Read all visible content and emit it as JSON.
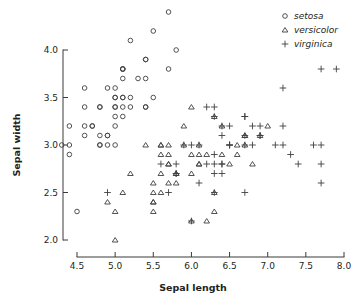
{
  "chart_data": {
    "type": "scatter",
    "title": "",
    "xlabel": "Sepal length",
    "ylabel": "Sepal width",
    "xlim": [
      4.25,
      8.05
    ],
    "ylim": [
      1.95,
      4.45
    ],
    "xticks": [
      "4.5",
      "5.0",
      "5.5",
      "6.0",
      "6.5",
      "7.0",
      "7.5",
      "8.0"
    ],
    "xtick_values": [
      4.5,
      5.0,
      5.5,
      6.0,
      6.5,
      7.0,
      7.5,
      8.0
    ],
    "yticks": [
      "2.0",
      "2.5",
      "3.0",
      "3.5",
      "4.0"
    ],
    "ytick_values": [
      2.0,
      2.5,
      3.0,
      3.5,
      4.0
    ],
    "grid": false,
    "legend_position": "top-right",
    "series": [
      {
        "name": "setosa",
        "marker": "circle",
        "color": "#3f3f3f",
        "points": [
          [
            5.1,
            3.5
          ],
          [
            4.9,
            3.0
          ],
          [
            4.7,
            3.2
          ],
          [
            4.6,
            3.1
          ],
          [
            5.0,
            3.6
          ],
          [
            5.4,
            3.9
          ],
          [
            4.6,
            3.4
          ],
          [
            5.0,
            3.4
          ],
          [
            4.4,
            2.9
          ],
          [
            4.9,
            3.1
          ],
          [
            5.4,
            3.7
          ],
          [
            4.8,
            3.4
          ],
          [
            4.8,
            3.0
          ],
          [
            4.3,
            3.0
          ],
          [
            5.8,
            4.0
          ],
          [
            5.7,
            4.4
          ],
          [
            5.4,
            3.9
          ],
          [
            5.1,
            3.5
          ],
          [
            5.7,
            3.8
          ],
          [
            5.1,
            3.8
          ],
          [
            5.4,
            3.4
          ],
          [
            5.1,
            3.7
          ],
          [
            4.6,
            3.6
          ],
          [
            5.1,
            3.3
          ],
          [
            4.8,
            3.4
          ],
          [
            5.0,
            3.0
          ],
          [
            5.0,
            3.4
          ],
          [
            5.2,
            3.5
          ],
          [
            5.2,
            3.4
          ],
          [
            4.7,
            3.2
          ],
          [
            4.8,
            3.1
          ],
          [
            5.4,
            3.4
          ],
          [
            5.2,
            4.1
          ],
          [
            5.5,
            4.2
          ],
          [
            4.9,
            3.1
          ],
          [
            5.0,
            3.2
          ],
          [
            5.5,
            3.5
          ],
          [
            4.9,
            3.6
          ],
          [
            4.4,
            3.0
          ],
          [
            5.1,
            3.4
          ],
          [
            5.0,
            3.5
          ],
          [
            4.5,
            2.3
          ],
          [
            4.4,
            3.2
          ],
          [
            5.0,
            3.5
          ],
          [
            5.1,
            3.8
          ],
          [
            4.8,
            3.0
          ],
          [
            5.1,
            3.8
          ],
          [
            4.6,
            3.2
          ],
          [
            5.3,
            3.7
          ],
          [
            5.0,
            3.3
          ]
        ]
      },
      {
        "name": "versicolor",
        "marker": "triangle",
        "color": "#3f3f3f",
        "points": [
          [
            7.0,
            3.2
          ],
          [
            6.4,
            3.2
          ],
          [
            6.9,
            3.1
          ],
          [
            5.5,
            2.3
          ],
          [
            6.5,
            2.8
          ],
          [
            5.7,
            2.8
          ],
          [
            6.3,
            3.3
          ],
          [
            4.9,
            2.4
          ],
          [
            6.6,
            2.9
          ],
          [
            5.2,
            2.7
          ],
          [
            5.0,
            2.0
          ],
          [
            5.9,
            3.0
          ],
          [
            6.0,
            2.2
          ],
          [
            6.1,
            2.9
          ],
          [
            5.6,
            2.9
          ],
          [
            6.7,
            3.1
          ],
          [
            5.6,
            3.0
          ],
          [
            5.8,
            2.7
          ],
          [
            6.2,
            2.2
          ],
          [
            5.6,
            2.5
          ],
          [
            5.9,
            3.2
          ],
          [
            6.1,
            2.8
          ],
          [
            6.3,
            2.5
          ],
          [
            6.1,
            2.8
          ],
          [
            6.4,
            2.9
          ],
          [
            6.6,
            3.0
          ],
          [
            6.8,
            2.8
          ],
          [
            6.7,
            3.0
          ],
          [
            6.0,
            2.9
          ],
          [
            5.7,
            2.6
          ],
          [
            5.5,
            2.4
          ],
          [
            5.5,
            2.4
          ],
          [
            5.8,
            2.7
          ],
          [
            6.0,
            2.7
          ],
          [
            5.4,
            3.0
          ],
          [
            6.0,
            3.4
          ],
          [
            6.7,
            3.1
          ],
          [
            6.3,
            2.3
          ],
          [
            5.6,
            3.0
          ],
          [
            5.5,
            2.5
          ],
          [
            5.5,
            2.6
          ],
          [
            6.1,
            3.0
          ],
          [
            5.8,
            2.6
          ],
          [
            5.0,
            2.3
          ],
          [
            5.6,
            2.7
          ],
          [
            5.7,
            3.0
          ],
          [
            5.7,
            2.9
          ],
          [
            6.2,
            2.9
          ],
          [
            5.1,
            2.5
          ],
          [
            5.7,
            2.8
          ]
        ]
      },
      {
        "name": "virginica",
        "marker": "plus",
        "color": "#3f3f3f",
        "points": [
          [
            6.3,
            3.3
          ],
          [
            5.8,
            2.7
          ],
          [
            7.1,
            3.0
          ],
          [
            6.3,
            2.9
          ],
          [
            6.5,
            3.0
          ],
          [
            7.6,
            3.0
          ],
          [
            4.9,
            2.5
          ],
          [
            7.3,
            2.9
          ],
          [
            6.7,
            2.5
          ],
          [
            7.2,
            3.6
          ],
          [
            6.5,
            3.2
          ],
          [
            6.4,
            2.7
          ],
          [
            6.8,
            3.0
          ],
          [
            5.7,
            2.5
          ],
          [
            5.8,
            2.8
          ],
          [
            6.4,
            3.2
          ],
          [
            6.5,
            3.0
          ],
          [
            7.7,
            3.8
          ],
          [
            7.7,
            2.6
          ],
          [
            6.0,
            2.2
          ],
          [
            6.9,
            3.2
          ],
          [
            5.6,
            2.8
          ],
          [
            7.7,
            2.8
          ],
          [
            6.3,
            2.7
          ],
          [
            6.7,
            3.3
          ],
          [
            7.2,
            3.2
          ],
          [
            6.2,
            2.8
          ],
          [
            6.1,
            3.0
          ],
          [
            6.4,
            2.8
          ],
          [
            7.2,
            3.0
          ],
          [
            7.4,
            2.8
          ],
          [
            7.9,
            3.8
          ],
          [
            6.4,
            2.8
          ],
          [
            6.3,
            2.8
          ],
          [
            6.1,
            2.6
          ],
          [
            7.7,
            3.0
          ],
          [
            6.3,
            3.4
          ],
          [
            6.4,
            3.1
          ],
          [
            6.0,
            3.0
          ],
          [
            6.9,
            3.1
          ],
          [
            6.7,
            3.1
          ],
          [
            6.9,
            3.1
          ],
          [
            5.8,
            2.7
          ],
          [
            6.8,
            3.2
          ],
          [
            6.7,
            3.3
          ],
          [
            6.7,
            3.0
          ],
          [
            6.3,
            2.5
          ],
          [
            6.5,
            3.0
          ],
          [
            6.2,
            3.4
          ],
          [
            5.9,
            3.0
          ]
        ]
      }
    ]
  },
  "legend": {
    "items": [
      {
        "label": "setosa",
        "marker": "circle-marker"
      },
      {
        "label": "versicolor",
        "marker": "triangle-marker"
      },
      {
        "label": "virginica",
        "marker": "plus-marker"
      }
    ]
  }
}
